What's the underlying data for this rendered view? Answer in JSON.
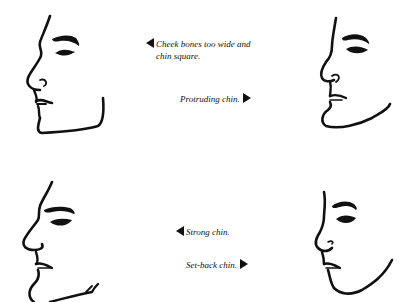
{
  "figures": [
    {
      "id": "top-left",
      "description": "Profile with wide cheek bones and square chin"
    },
    {
      "id": "top-right",
      "description": "Profile with protruding chin"
    },
    {
      "id": "bottom-left",
      "description": "Profile with strong chin"
    },
    {
      "id": "bottom-right",
      "description": "Profile with set-back chin"
    }
  ],
  "captions": {
    "cheek_bones_line1": "Cheek bones too wide and",
    "cheek_bones_line2": "chin square.",
    "protruding_chin": "Protruding chin.",
    "strong_chin": "Strong chin.",
    "setback_chin": "Set-back chin."
  },
  "colors": {
    "ink": "#111111",
    "paper": "#ffffff"
  }
}
